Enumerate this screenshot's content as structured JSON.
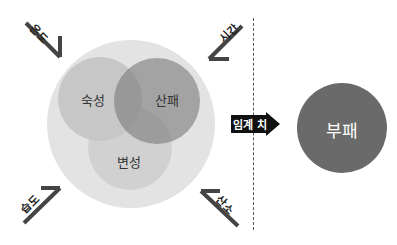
{
  "diagram": {
    "type": "venn-process",
    "inner_circles": [
      {
        "label": "숙성",
        "shade": "#bdbdbd"
      },
      {
        "label": "산패",
        "shade": "#7a7a7a"
      },
      {
        "label": "변성",
        "shade": "#c8c8c8"
      }
    ],
    "outer_circle_color": "#e3e3e3",
    "factors": [
      {
        "label": "온도",
        "position": "top-left"
      },
      {
        "label": "시간",
        "position": "top-right"
      },
      {
        "label": "습도",
        "position": "bottom-left"
      },
      {
        "label": "산소",
        "position": "bottom-right"
      }
    ],
    "threshold": {
      "label": "임계 치"
    },
    "result": {
      "label": "부패",
      "color": "#6a6a6a"
    }
  }
}
